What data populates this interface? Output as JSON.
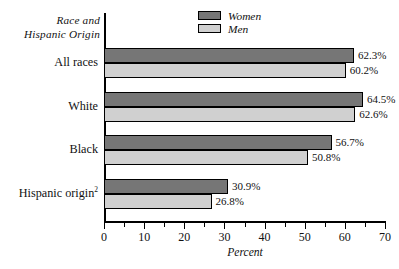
{
  "chart_data": {
    "type": "bar",
    "orientation": "horizontal",
    "title": "",
    "xlabel": "Percent",
    "ylabel": "Race and Hispanic Origin",
    "ylabel_lines": [
      "Race and",
      "Hispanic Origin"
    ],
    "categories": [
      "All races",
      "White",
      "Black",
      "Hispanic origin"
    ],
    "category_footnotes": [
      "",
      "",
      "",
      "2"
    ],
    "series": [
      {
        "name": "Women",
        "values": [
          62.3,
          64.5,
          56.7,
          30.9
        ],
        "color": "#767676"
      },
      {
        "name": "Men",
        "values": [
          60.2,
          62.6,
          50.8,
          26.8
        ],
        "color": "#d0d0d0"
      }
    ],
    "value_labels": {
      "Women": [
        "62.3%",
        "64.5%",
        "56.7%",
        "30.9%"
      ],
      "Men": [
        "60.2%",
        "62.6%",
        "50.8%",
        "26.8%"
      ]
    },
    "xlim": [
      0,
      70
    ],
    "xticks": [
      0,
      10,
      20,
      30,
      40,
      50,
      60,
      70
    ],
    "xtick_labels": [
      "0",
      "10",
      "20",
      "30",
      "40",
      "50",
      "60",
      "70"
    ],
    "xminor_ticks": [
      5,
      15,
      25,
      35,
      45,
      55,
      65
    ],
    "grid": false,
    "legend_position": "top-center"
  },
  "legend": {
    "entries": [
      {
        "label": "Women",
        "swatch": "dark-gray-swatch"
      },
      {
        "label": "Men",
        "swatch": "light-gray-swatch"
      }
    ]
  }
}
